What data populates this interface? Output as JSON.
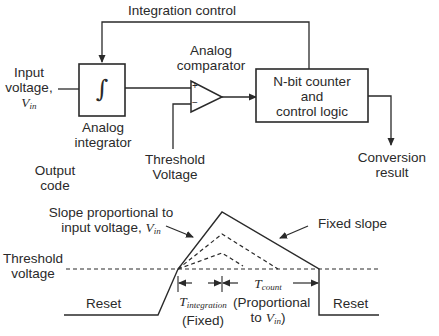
{
  "block_diagram": {
    "feedback_label": "Integration control",
    "input_label_line1": "Input",
    "input_label_line2": "voltage,",
    "input_symbol": "V",
    "input_symbol_sub": "in",
    "integrator_symbol": "∫",
    "integrator_label_line1": "Analog",
    "integrator_label_line2": "integrator",
    "comparator_label_line1": "Analog",
    "comparator_label_line2": "comparator",
    "comparator_plus": "+",
    "comparator_minus": "−",
    "threshold_label_line1": "Threshold",
    "threshold_label_line2": "Voltage",
    "counter_line1": "N-bit counter",
    "counter_line2": "and",
    "counter_line3": "control logic",
    "output_label_line1": "Conversion",
    "output_label_line2": "result"
  },
  "waveform": {
    "title_line1": "Output",
    "title_line2": "code",
    "slope_note_line1": "Slope proportional to",
    "slope_note_line2": "input voltage,",
    "slope_note_symbol": "V",
    "slope_note_sub": "in",
    "fixed_slope_label": "Fixed slope",
    "threshold_line1": "Threshold",
    "threshold_line2": "voltage",
    "reset_left": "Reset",
    "reset_right": "Reset",
    "t_integration_symbol": "T",
    "t_integration_sub": "integration",
    "t_integration_note": "(Fixed)",
    "t_count_symbol": "T",
    "t_count_sub": "count",
    "t_count_note_line1": "(Proportional",
    "t_count_note_line2": "to",
    "t_count_note_symbol": "V",
    "t_count_note_sub": "in",
    "t_count_note_close": ")"
  },
  "colors": {
    "line": "#2a2a2a",
    "background": "#ffffff"
  }
}
